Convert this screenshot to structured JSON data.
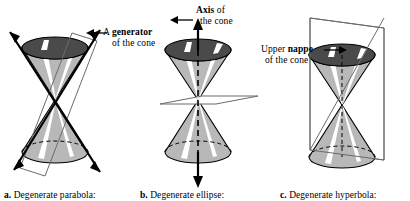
{
  "figure": {
    "background_color": "#ffffff",
    "ink_color": "#000000",
    "nappe_top_fill": "#4a4a4a",
    "cone_body_fill": "#b8b8b8",
    "cone_highlight_fill": "#ffffff",
    "plane_fill": "#ffffff",
    "plane_stroke": "#6b6b6b"
  },
  "annotations": [
    {
      "name": "generator",
      "line1_plain": "A ",
      "line1_bold": "generator",
      "line2": "of the cone",
      "arrow": "left-arrow"
    },
    {
      "name": "axis",
      "line1_bold": "Axis",
      "line1_plain": " of",
      "line2": "the cone",
      "arrow": "left-arrow"
    },
    {
      "name": "nappe",
      "line1_plain": "Upper ",
      "line1_bold": "nappe",
      "line2": "of the cone",
      "arrow": "right-arrow"
    }
  ],
  "panels": [
    {
      "letter": "a.",
      "caption": "Degenerate parabola:",
      "description": "plane tangent along a generator",
      "plane_orientation": "tangent-oblique"
    },
    {
      "letter": "b.",
      "caption": "Degenerate ellipse:",
      "description": "plane through vertex only",
      "plane_orientation": "horizontal-through-vertex"
    },
    {
      "letter": "c.",
      "caption": "Degenerate hyperbola:",
      "description": "plane through the axis",
      "plane_orientation": "vertical-through-axis"
    }
  ],
  "captions": {
    "a_letter": "a.",
    "a_text": "Degenerate parabola:",
    "b_letter": "b.",
    "b_text": "Degenerate ellipse:",
    "c_letter": "c.",
    "c_text": "Degenerate hyperbola:"
  },
  "labels": {
    "generator_line1_a": "A ",
    "generator_line1_b": "generator",
    "generator_line2": "of the cone",
    "axis_line1_b": "Axis",
    "axis_line1_a": " of",
    "axis_line2": "the cone",
    "nappe_line1_a": "Upper ",
    "nappe_line1_b": "nappe",
    "nappe_line2": "of the cone"
  }
}
